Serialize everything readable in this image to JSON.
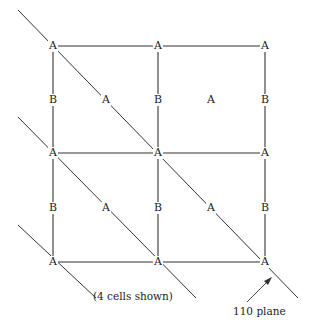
{
  "diagram": {
    "grid": {
      "columns_x": [
        53,
        158,
        265
      ],
      "rows_y": [
        46,
        153,
        262
      ]
    },
    "corner_atom_label": "A",
    "edge_atom_label": "B",
    "face_atom_label": "A",
    "nodes": [
      {
        "label": "A",
        "x": 53,
        "y": 46
      },
      {
        "label": "A",
        "x": 158,
        "y": 46
      },
      {
        "label": "A",
        "x": 265,
        "y": 46
      },
      {
        "label": "B",
        "x": 53,
        "y": 100
      },
      {
        "label": "A",
        "x": 106,
        "y": 100
      },
      {
        "label": "B",
        "x": 158,
        "y": 100
      },
      {
        "label": "A",
        "x": 211,
        "y": 100
      },
      {
        "label": "B",
        "x": 265,
        "y": 100
      },
      {
        "label": "A",
        "x": 53,
        "y": 153
      },
      {
        "label": "A",
        "x": 158,
        "y": 153
      },
      {
        "label": "A",
        "x": 265,
        "y": 153
      },
      {
        "label": "B",
        "x": 53,
        "y": 208
      },
      {
        "label": "A",
        "x": 106,
        "y": 208
      },
      {
        "label": "B",
        "x": 158,
        "y": 208
      },
      {
        "label": "A",
        "x": 211,
        "y": 208
      },
      {
        "label": "B",
        "x": 265,
        "y": 208
      },
      {
        "label": "A",
        "x": 53,
        "y": 262
      },
      {
        "label": "A",
        "x": 158,
        "y": 262
      },
      {
        "label": "A",
        "x": 265,
        "y": 262
      }
    ],
    "planes": [
      {
        "x1": 18,
        "y1": 10,
        "x2": 298,
        "y2": 298
      },
      {
        "x1": 18,
        "y1": 117,
        "x2": 196,
        "y2": 298
      },
      {
        "x1": 18,
        "y1": 225,
        "x2": 96,
        "y2": 298
      }
    ],
    "cells_caption": "(4 cells shown)",
    "plane_caption": "110 plane",
    "line_color": "#333333"
  }
}
